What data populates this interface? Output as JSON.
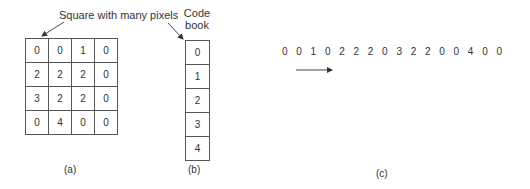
{
  "panel_a": {
    "annotation": "Square with many pixels",
    "grid": [
      [
        "0",
        "0",
        "1",
        "0"
      ],
      [
        "2",
        "2",
        "2",
        "0"
      ],
      [
        "3",
        "2",
        "2",
        "0"
      ],
      [
        "0",
        "4",
        "0",
        "0"
      ]
    ],
    "caption": "(a)"
  },
  "panel_b": {
    "title_line1": "Code",
    "title_line2": "book",
    "entries": [
      "0",
      "1",
      "2",
      "3",
      "4"
    ],
    "caption": "(b)"
  },
  "panel_c": {
    "stream": [
      "0",
      "0",
      "1",
      "0",
      "2",
      "2",
      "2",
      "0",
      "3",
      "2",
      "2",
      "0",
      "0",
      "4",
      "0",
      "0"
    ],
    "arrow_direction": "right",
    "caption": "(c)"
  },
  "colors": {
    "line": "#555555",
    "text": "#333333",
    "background": "#ffffff"
  }
}
